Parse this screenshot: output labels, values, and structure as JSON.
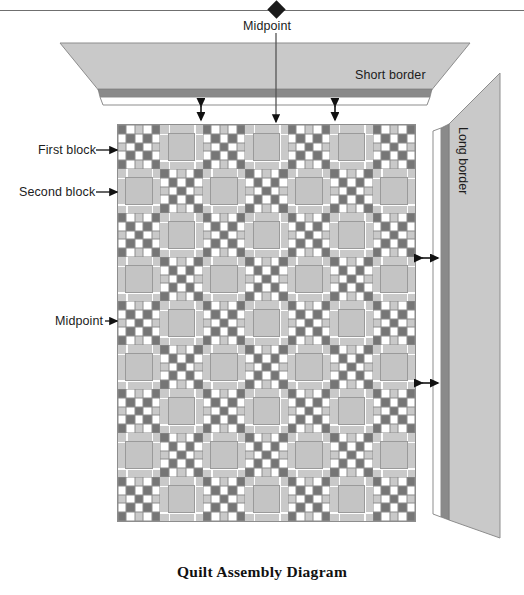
{
  "title": "Quilt Assembly Diagram",
  "labels": {
    "midpoint_top": "Midpoint",
    "midpoint_left": "Midpoint",
    "first_block": "First block",
    "second_block": "Second block",
    "short_border": "Short border",
    "long_border": "Long border"
  },
  "markers": {
    "top_diamond": "diamond-marker",
    "top_rule": "horizontal-rule"
  },
  "colors": {
    "dark_square": "#767676",
    "light_square": "#c9c9c9",
    "white_square": "#ffffff",
    "border_light": "#c9c9c9",
    "border_dark_stripe": "#8a8a8a",
    "outline": "#8d8d8d",
    "text": "#1c1c1c",
    "marker": "#1a1a1a"
  },
  "quilt": {
    "columns": 7,
    "rows": 9,
    "block_types": [
      "checkerboard-5x5",
      "square-in-square"
    ],
    "arrangement": "alternating checkerboard by row and column",
    "checkerboard_grid": 5,
    "checkerboard_pattern": [
      [
        "dark",
        "white",
        "light",
        "white",
        "dark"
      ],
      [
        "white",
        "dark",
        "white",
        "dark",
        "white"
      ],
      [
        "light",
        "white",
        "dark",
        "white",
        "light"
      ],
      [
        "white",
        "dark",
        "white",
        "dark",
        "white"
      ],
      [
        "dark",
        "white",
        "light",
        "white",
        "dark"
      ]
    ]
  },
  "annotations": {
    "top_arrows_count": 2,
    "right_arrows_count": 2,
    "top_arrow_type": "double-headed-vertical",
    "right_arrow_type": "double-headed-horizontal",
    "midpoint_top_arrow": "down-arrow-to-quilt-top-center",
    "midpoint_left_arrow": "right-arrow-to-quilt-left-center",
    "first_block_arrow": "right-arrow",
    "second_block_arrow": "right-arrow"
  }
}
